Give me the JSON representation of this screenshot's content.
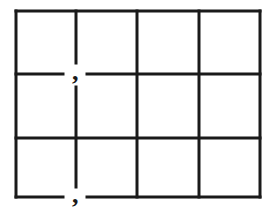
{
  "figure": {
    "type": "grid",
    "rows": 3,
    "columns": 4,
    "stroke_color": "#1a1a1a",
    "background_color": "#ffffff",
    "bounds": {
      "left": 16,
      "top": 11,
      "right": 260,
      "bottom": 197
    },
    "vertical_lines_x": [
      76,
      137,
      199
    ],
    "horizontal_lines_y": [
      74,
      138
    ],
    "marks": [
      {
        "symbol": ",",
        "x": 76,
        "y": 75,
        "position": "intersection row1/col1 (interior)"
      },
      {
        "symbol": ",",
        "x": 76,
        "y": 198,
        "position": "bottom border at col1 line"
      }
    ]
  }
}
